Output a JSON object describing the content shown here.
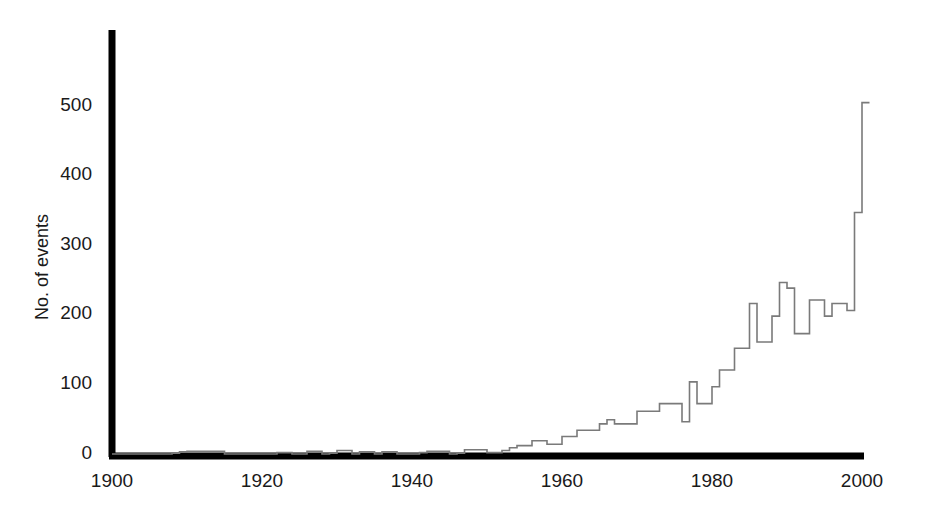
{
  "chart_data": {
    "type": "line",
    "title": "",
    "xlabel": "",
    "ylabel": "No. of events",
    "xlim": [
      1900,
      2001
    ],
    "ylim": [
      0,
      580
    ],
    "grid": false,
    "legend": null,
    "line_style": "step",
    "line_color": "#7a7a7a",
    "axis_color": "#000000",
    "background_color": "#ffffff",
    "x_ticks": [
      1900,
      1920,
      1940,
      1960,
      1980,
      2000
    ],
    "y_ticks": [
      0,
      100,
      200,
      300,
      400,
      500
    ],
    "x_tick_labels": [
      "1900",
      "1920",
      "1940",
      "1960",
      "1980",
      "2000"
    ],
    "y_tick_labels": [
      "0",
      "100",
      "200",
      "300",
      "400",
      "500"
    ],
    "x": [
      1900,
      1901,
      1902,
      1903,
      1904,
      1905,
      1906,
      1907,
      1908,
      1909,
      1910,
      1911,
      1912,
      1913,
      1914,
      1915,
      1916,
      1917,
      1918,
      1919,
      1920,
      1921,
      1922,
      1923,
      1924,
      1925,
      1926,
      1927,
      1928,
      1929,
      1930,
      1931,
      1932,
      1933,
      1934,
      1935,
      1936,
      1937,
      1938,
      1939,
      1940,
      1941,
      1942,
      1943,
      1944,
      1945,
      1946,
      1947,
      1948,
      1949,
      1950,
      1951,
      1952,
      1953,
      1954,
      1955,
      1956,
      1957,
      1958,
      1959,
      1960,
      1961,
      1962,
      1963,
      1964,
      1965,
      1966,
      1967,
      1968,
      1969,
      1970,
      1971,
      1972,
      1973,
      1974,
      1975,
      1976,
      1977,
      1978,
      1979,
      1980,
      1981,
      1982,
      1983,
      1984,
      1985,
      1986,
      1987,
      1988,
      1989,
      1990,
      1991,
      1992,
      1993,
      1994,
      1995,
      1996,
      1997,
      1998,
      1999,
      2000
    ],
    "values": [
      0,
      0,
      0,
      0,
      0,
      0,
      0,
      0,
      1,
      3,
      4,
      4,
      4,
      4,
      4,
      0,
      0,
      0,
      0,
      0,
      0,
      0,
      2,
      2,
      0,
      0,
      4,
      4,
      0,
      1,
      5,
      5,
      0,
      3,
      3,
      0,
      3,
      3,
      0,
      0,
      0,
      2,
      4,
      4,
      4,
      0,
      1,
      6,
      6,
      6,
      2,
      2,
      5,
      9,
      12,
      12,
      19,
      19,
      14,
      14,
      25,
      25,
      34,
      34,
      34,
      43,
      49,
      43,
      43,
      43,
      61,
      61,
      61,
      72,
      72,
      72,
      46,
      103,
      72,
      72,
      96,
      120,
      120,
      151,
      151,
      215,
      160,
      160,
      197,
      245,
      237,
      172,
      172,
      220,
      220,
      197,
      215,
      215,
      205,
      345,
      502
    ]
  },
  "figure": {
    "y_axis_title": "No. of events"
  }
}
